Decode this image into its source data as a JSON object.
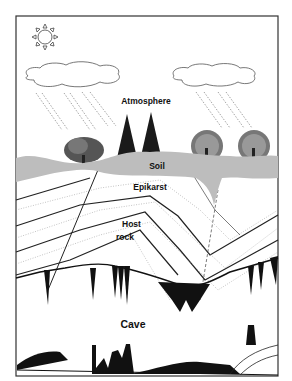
{
  "diagram": {
    "type": "cross-section",
    "labels": {
      "atmosphere": "Atmosphere",
      "soil": "Soil",
      "epikarst": "Epikarst",
      "host_rock_line1": "Host",
      "host_rock_line2": "rock",
      "cave": "Cave"
    },
    "icons": [
      "sun-icon",
      "cloud-icon",
      "rain-icon",
      "deciduous-tree-icon",
      "conifer-tree-icon",
      "stalactite-icon",
      "stalagmite-icon"
    ],
    "colors": {
      "frame": "#333333",
      "soil": "#bdbdbd",
      "rock_lines": "#222222",
      "cave_fill": "#111111",
      "background": "#ffffff"
    }
  }
}
